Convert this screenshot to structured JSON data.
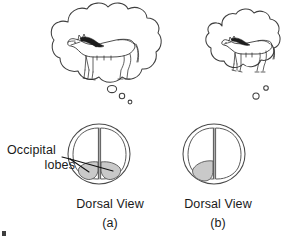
{
  "figure": {
    "background_color": "#ffffff",
    "ink_color": "#3b3b3b",
    "lobe_fill_color": "#c9c9c9",
    "width": 300,
    "height": 239
  },
  "labels": {
    "occipital_line1": "Occipital",
    "occipital_line2": "lobes"
  },
  "panels": [
    {
      "id": "a",
      "letter": "(a)",
      "caption": "Dorsal View",
      "thought_content": "horse",
      "thought_size": "large",
      "shaded_lobes": 2,
      "shaded_lobe_sides": [
        "left",
        "right"
      ]
    },
    {
      "id": "b",
      "letter": "(b)",
      "caption": "Dorsal View",
      "thought_content": "horse",
      "thought_size": "small",
      "shaded_lobes": 1,
      "shaded_lobe_sides": [
        "left"
      ]
    }
  ],
  "icons": {
    "thought_bubble": "thought-bubble-icon",
    "horse": "horse-icon",
    "brain": "brain-dorsal-icon"
  }
}
